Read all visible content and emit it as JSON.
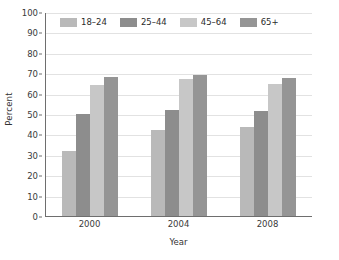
{
  "chart_data": {
    "type": "bar",
    "title": "",
    "xlabel": "Year",
    "ylabel": "Percent",
    "categories": [
      "2000",
      "2004",
      "2008"
    ],
    "series": [
      {
        "name": "18–24",
        "color": "#b9b9b9",
        "values": [
          32,
          42,
          43.5
        ]
      },
      {
        "name": "25–44",
        "color": "#8d8d8d",
        "values": [
          50,
          52,
          51.5
        ]
      },
      {
        "name": "45–64",
        "color": "#c7c7c7",
        "values": [
          64,
          67,
          64.5
        ]
      },
      {
        "name": "65+",
        "color": "#959595",
        "values": [
          68,
          69,
          67.5
        ]
      }
    ],
    "ylim": [
      0,
      100
    ],
    "ytick_step": 10,
    "yticks": [
      "0",
      "10",
      "20",
      "30",
      "40",
      "50",
      "60",
      "70",
      "80",
      "90",
      "100"
    ],
    "grid": true,
    "legend_position": "top-inside",
    "axis_color": "#6e6e6e",
    "grid_color": "#e2e2e2",
    "background": "#ffffff"
  }
}
